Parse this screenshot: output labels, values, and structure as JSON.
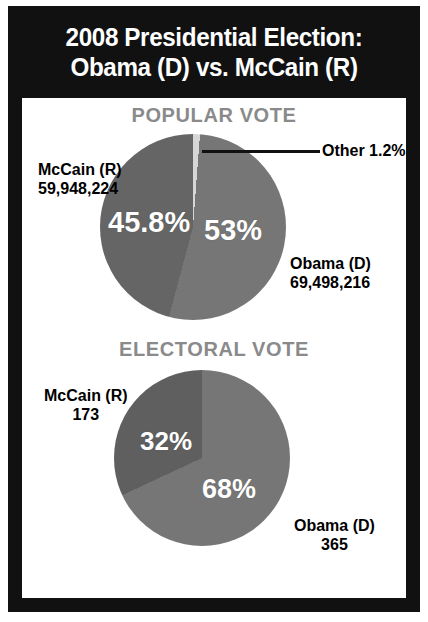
{
  "title": {
    "line1": "2008 Presidential Election:",
    "line2": "Obama (D) vs. McCain (R)"
  },
  "sections": {
    "popular": {
      "heading": "POPULAR VOTE",
      "mccain": {
        "name": "McCain (R)",
        "votes": "59,948,224",
        "pct": "45.8%"
      },
      "obama": {
        "name": "Obama (D)",
        "votes": "69,498,216",
        "pct": "53%"
      },
      "other": {
        "label": "Other 1.2%"
      }
    },
    "electoral": {
      "heading": "ELECTORAL VOTE",
      "mccain": {
        "name": "McCain (R)",
        "votes": "173",
        "pct": "32%"
      },
      "obama": {
        "name": "Obama (D)",
        "votes": "365",
        "pct": "68%"
      }
    }
  },
  "colors": {
    "frame": "#111111",
    "background": "#ffffff",
    "heading": "#8a8a8a",
    "obama_slice": "#767676",
    "mccain_slice": "#656565",
    "other_slice": "#d6d6d6",
    "label_text": "#ffffff"
  },
  "chart_data": [
    {
      "type": "pie",
      "title": "POPULAR VOTE",
      "categories": [
        "Obama (D)",
        "McCain (R)",
        "Other"
      ],
      "values": [
        53,
        45.8,
        1.2
      ],
      "raw_values": [
        69498216,
        59948224,
        null
      ],
      "labels": [
        "53%",
        "45.8%",
        "Other 1.2%"
      ],
      "legend": "callouts",
      "start_angle_deg": 0,
      "direction": "clockwise"
    },
    {
      "type": "pie",
      "title": "ELECTORAL VOTE",
      "categories": [
        "Obama (D)",
        "McCain (R)"
      ],
      "values": [
        68,
        32
      ],
      "raw_values": [
        365,
        173
      ],
      "labels": [
        "68%",
        "32%"
      ],
      "legend": "callouts",
      "start_angle_deg": 0,
      "direction": "clockwise"
    }
  ]
}
